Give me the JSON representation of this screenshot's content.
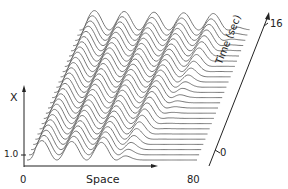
{
  "chart_data": {
    "type": "waterfall-line",
    "title": "",
    "xlabel": "Space",
    "ylabel": "X",
    "zlabel": "Time (sec)",
    "x_ticks": [
      "0",
      "80"
    ],
    "y_ticks": [
      "1.0"
    ],
    "z_ticks": [
      "0",
      "16"
    ],
    "x_range": [
      0,
      80
    ],
    "z_range": [
      0,
      16
    ],
    "trace_count": 26,
    "series": [
      {
        "name": "t=0",
        "peaks_approx_space": [
          6,
          20,
          34
        ],
        "flat_after_space": 45
      },
      {
        "name": "t=8",
        "peaks_approx_space": [
          6,
          20,
          34,
          48
        ],
        "flat_after_space": 58
      },
      {
        "name": "t=16",
        "peaks_approx_space": [
          6,
          20,
          34,
          48,
          62
        ],
        "flat_after_space": 72
      }
    ],
    "grid": false,
    "legend": null
  },
  "labels": {
    "x_axis_symbol": "X",
    "y_tick_1": "1.0",
    "space_origin": "0",
    "space_label": "Space",
    "space_end": "80",
    "time_start": "0",
    "time_end": "16",
    "time_label": "Time (sec)"
  },
  "colors": {
    "line": "#555555",
    "axis": "#222222",
    "background": "#ffffff"
  }
}
